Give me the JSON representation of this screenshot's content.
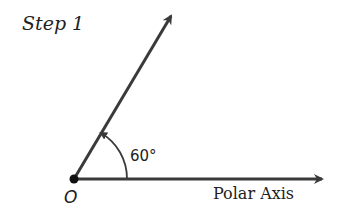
{
  "title": "Step 1",
  "diagram": {
    "angle_label": "60°",
    "angle_degrees": 60,
    "origin_label": "O",
    "axis_label": "Polar Axis",
    "stroke_color": "#3a3a3a"
  }
}
